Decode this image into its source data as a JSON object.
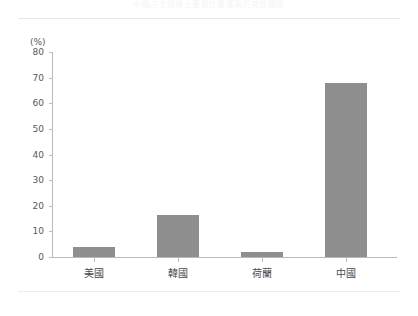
{
  "figure": {
    "caption_top": "中國占全球稀土產量比重遠高於其他國家",
    "width": 418,
    "height": 316,
    "background": "#ffffff",
    "rule_color": "#e8e8ea"
  },
  "chart_data": {
    "type": "bar",
    "title": "",
    "xlabel": "",
    "ylabel": "(%)",
    "categories": [
      "美國",
      "韓國",
      "荷蘭",
      "中國"
    ],
    "values": [
      4,
      16.5,
      2,
      68
    ],
    "ylim": [
      0,
      80
    ],
    "yticks": [
      0,
      10,
      20,
      30,
      40,
      50,
      60,
      70,
      80
    ],
    "ytick_labels": [
      "0",
      "10",
      "20",
      "30",
      "40",
      "50",
      "60",
      "70",
      "80"
    ],
    "grid": false,
    "legend": false,
    "bar_color": "#8e8e8e",
    "axis_color": "#b9b9bd",
    "tick_label_color": "#58585c"
  }
}
